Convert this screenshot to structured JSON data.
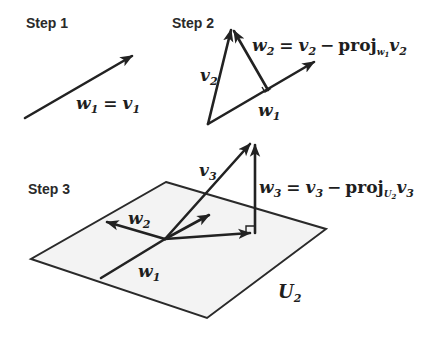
{
  "steps": [
    {
      "label": "Step 1",
      "equation": {
        "lhs": "w",
        "lhs_sub": "1",
        "eq": "=",
        "rhs": "v",
        "rhs_sub": "1"
      }
    },
    {
      "label": "Step 2",
      "vector_labels": {
        "v2": "v",
        "v2_sub": "2",
        "w1": "w",
        "w1_sub": "1"
      },
      "equation": {
        "lhs": "w",
        "lhs_sub": "2",
        "eq": "=",
        "a": "v",
        "a_sub": "2",
        "minus": "−",
        "proj": "proj",
        "proj_sub": "w",
        "proj_sub_sub": "1",
        "b": "v",
        "b_sub": "2"
      }
    },
    {
      "label": "Step 3",
      "vector_labels": {
        "v3": "v",
        "v3_sub": "3",
        "w1": "w",
        "w1_sub": "1",
        "w2": "w",
        "w2_sub": "2"
      },
      "plane_label": "U",
      "plane_label_sub": "2",
      "equation": {
        "lhs": "w",
        "lhs_sub": "3",
        "eq": "=",
        "a": "v",
        "a_sub": "3",
        "minus": "−",
        "proj": "proj",
        "proj_sub": "U",
        "proj_sub_sub": "2",
        "b": "v",
        "b_sub": "3"
      }
    }
  ],
  "colors": {
    "ink": "#222222",
    "plane_fill": "#f3f3f3",
    "background": "#ffffff"
  }
}
